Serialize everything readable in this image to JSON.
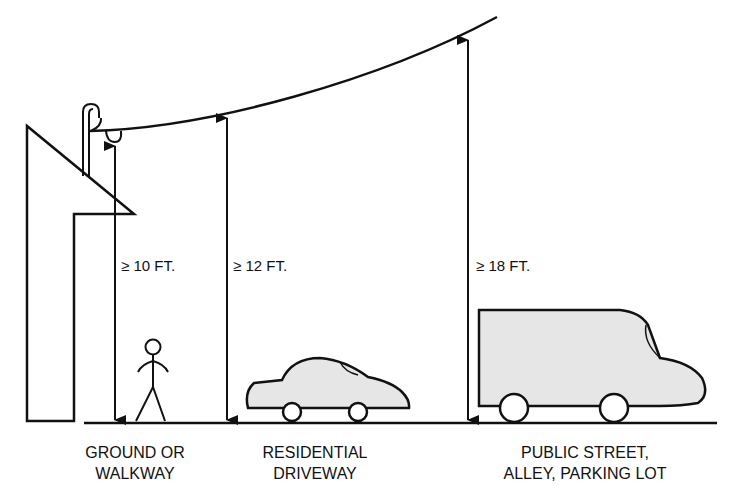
{
  "diagram": {
    "clearances": [
      {
        "label": "≥ 10 FT.",
        "location": "ground-or-walkway"
      },
      {
        "label": "≥ 12 FT.",
        "location": "residential-driveway"
      },
      {
        "label": "≥ 18 FT.",
        "location": "public-street"
      }
    ],
    "captions": [
      {
        "line1": "GROUND OR",
        "line2": "WALKWAY"
      },
      {
        "line1": "RESIDENTIAL",
        "line2": "DRIVEWAY"
      },
      {
        "line1": "PUBLIC STREET,",
        "line2": "ALLEY, PARKING LOT"
      }
    ],
    "colors": {
      "stroke": "#111111",
      "fill_vehicle": "#e6e6e6",
      "background": "#ffffff"
    }
  }
}
